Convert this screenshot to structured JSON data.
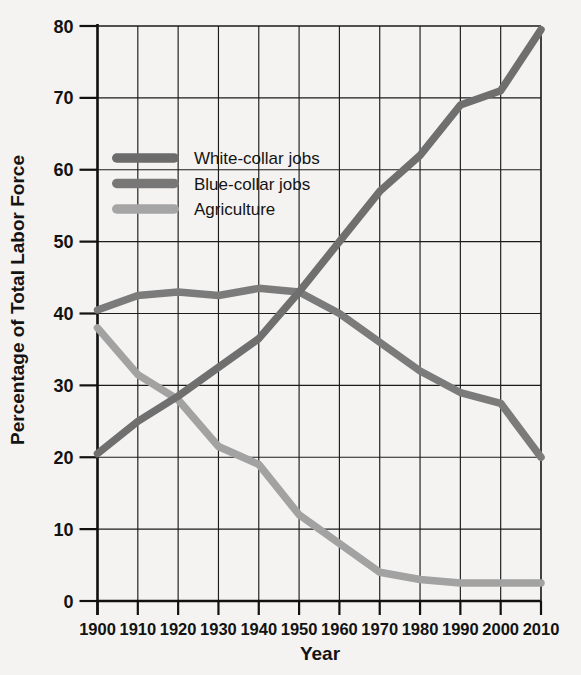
{
  "chart_data": {
    "type": "line",
    "title": "",
    "xlabel": "Year",
    "ylabel": "Percentage of Total Labor Force",
    "x": [
      1900,
      1910,
      1920,
      1930,
      1940,
      1950,
      1960,
      1970,
      1980,
      1990,
      2000,
      2010
    ],
    "xlim": [
      1900,
      2010
    ],
    "ylim": [
      0,
      80
    ],
    "xticks": [
      "1900",
      "1910",
      "1920",
      "1930",
      "1940",
      "1950",
      "1960",
      "1970",
      "1980",
      "1990",
      "2000",
      "2010"
    ],
    "yticks": [
      "0",
      "10",
      "20",
      "30",
      "40",
      "50",
      "60",
      "70",
      "80"
    ],
    "grid": true,
    "legend_position": "upper-left-inside",
    "series": [
      {
        "name": "White-collar jobs",
        "color": "#6f6f6f",
        "values": [
          20.5,
          25.0,
          28.5,
          32.5,
          36.5,
          43.0,
          50.0,
          57.0,
          62.0,
          69.0,
          71.0,
          79.5
        ]
      },
      {
        "name": "Blue-collar jobs",
        "color": "#7b7b7b",
        "values": [
          40.5,
          42.5,
          43.0,
          42.5,
          43.5,
          43.0,
          40.0,
          36.0,
          32.0,
          29.0,
          27.5,
          20.0
        ]
      },
      {
        "name": "Agriculture",
        "color": "#a2a2a2",
        "values": [
          38.0,
          31.5,
          28.0,
          21.5,
          19.0,
          12.0,
          8.0,
          4.0,
          3.0,
          2.5,
          2.5,
          2.5
        ]
      }
    ]
  },
  "legend": {
    "items": [
      {
        "label": "White-collar jobs",
        "swatch_color": "#6b6b6b"
      },
      {
        "label": "Blue-collar jobs",
        "swatch_color": "#777777"
      },
      {
        "label": "Agriculture",
        "swatch_color": "#a5a5a5"
      }
    ]
  },
  "axes": {
    "y_title": "Percentage of Total Labor Force",
    "x_title": "Year"
  }
}
